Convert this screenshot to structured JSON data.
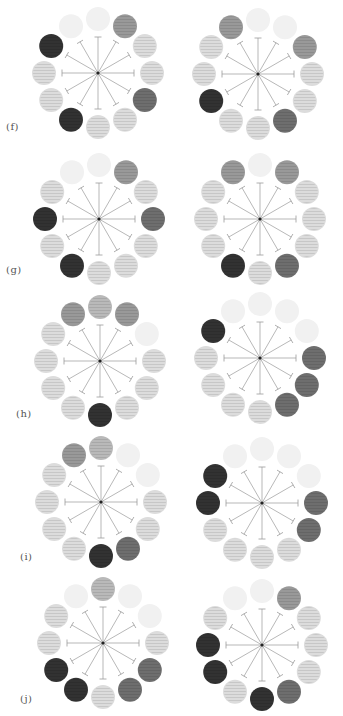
{
  "figure": {
    "shade_colors": {
      "faint": "#f1f1f1",
      "light": "#dcdcdc",
      "midlight": "#b9b9b9",
      "mid": "#999999",
      "dark": "#6e6e6e",
      "black": "#333333"
    },
    "spoke_color": "#9a9a9a",
    "center_dot_color": "#222222",
    "rows": [
      {
        "label": "(f)",
        "label_pos": [
          6,
          121
        ],
        "wheels": [
          {
            "center": [
              98,
              73
            ],
            "positions": [
              "faint",
              "mid",
              "light",
              "light",
              "dark",
              "light",
              "light",
              "black",
              "light",
              "light",
              "black",
              "faint"
            ]
          },
          {
            "center": [
              258,
              74
            ],
            "positions": [
              "faint",
              "faint",
              "mid",
              "light",
              "light",
              "dark",
              "light",
              "light",
              "black",
              "light",
              "light",
              "mid"
            ]
          }
        ]
      },
      {
        "label": "(g)",
        "label_pos": [
          6,
          264
        ],
        "wheels": [
          {
            "center": [
              99,
              219
            ],
            "positions": [
              "faint",
              "mid",
              "light",
              "dark",
              "light",
              "light",
              "light",
              "black",
              "light",
              "black",
              "light",
              "faint"
            ]
          },
          {
            "center": [
              260,
              219
            ],
            "positions": [
              "faint",
              "mid",
              "light",
              "light",
              "light",
              "dark",
              "light",
              "black",
              "light",
              "light",
              "light",
              "mid"
            ]
          }
        ]
      },
      {
        "label": "(h)",
        "label_pos": [
          16,
          408
        ],
        "wheels": [
          {
            "center": [
              100,
              361
            ],
            "positions": [
              "midlight",
              "mid",
              "faint",
              "light",
              "light",
              "light",
              "black",
              "light",
              "light",
              "light",
              "light",
              "mid"
            ]
          },
          {
            "center": [
              260,
              358
            ],
            "positions": [
              "faint",
              "faint",
              "faint",
              "dark",
              "dark",
              "dark",
              "light",
              "light",
              "light",
              "light",
              "black",
              "faint"
            ]
          }
        ]
      },
      {
        "label": "(i)",
        "label_pos": [
          20,
          551
        ],
        "wheels": [
          {
            "center": [
              101,
              502
            ],
            "positions": [
              "midlight",
              "faint",
              "faint",
              "light",
              "light",
              "dark",
              "black",
              "light",
              "light",
              "light",
              "light",
              "mid"
            ]
          },
          {
            "center": [
              262,
              503
            ],
            "positions": [
              "faint",
              "faint",
              "faint",
              "dark",
              "dark",
              "light",
              "light",
              "light",
              "light",
              "black",
              "black",
              "faint"
            ]
          }
        ]
      },
      {
        "label": "(j)",
        "label_pos": [
          20,
          693
        ],
        "wheels": [
          {
            "center": [
              103,
              643
            ],
            "positions": [
              "midlight",
              "faint",
              "faint",
              "light",
              "dark",
              "dark",
              "light",
              "black",
              "black",
              "light",
              "light",
              "faint"
            ]
          },
          {
            "center": [
              262,
              645
            ],
            "positions": [
              "faint",
              "mid",
              "light",
              "light",
              "light",
              "dark",
              "black",
              "light",
              "black",
              "black",
              "light",
              "faint"
            ]
          }
        ]
      }
    ],
    "geometry": {
      "ball_orbit_radius": 54,
      "ball_radius": 12,
      "spoke_length": 36,
      "tbar_half_width": 3.5
    }
  }
}
